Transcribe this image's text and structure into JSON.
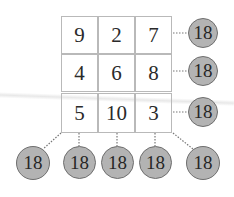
{
  "grid": {
    "rows": [
      [
        "9",
        "2",
        "7"
      ],
      [
        "4",
        "6",
        "8"
      ],
      [
        "5",
        "10",
        "3"
      ]
    ]
  },
  "sums": {
    "rows": [
      "18",
      "18",
      "18"
    ],
    "columns": [
      "18",
      "18",
      "18"
    ],
    "diagonals": [
      "18",
      "18"
    ]
  },
  "colors": {
    "circle_fill": "#b3b3b3",
    "circle_border": "#6e6e6e",
    "grid_line": "#b9b9b9",
    "connector": "#777777"
  }
}
